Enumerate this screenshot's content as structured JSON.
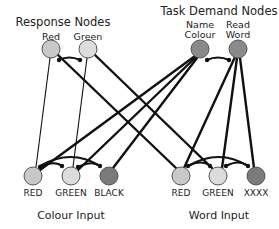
{
  "titles": {
    "response": "Response Nodes",
    "task": "Task Demand Nodes",
    "colour_input": "Colour Input",
    "word_input": "Word Input"
  },
  "response_nodes": [
    {
      "label": "Red",
      "x": 51,
      "y": 49,
      "fill": "#c8c8c8"
    },
    {
      "label": "Green",
      "x": 88,
      "y": 49,
      "fill": "#dcdcdc"
    }
  ],
  "task_nodes": [
    {
      "label_line1": "Name",
      "label_line2": "Colour",
      "x": 200,
      "y": 49,
      "fill": "#8a8a8a"
    },
    {
      "label_line1": "Read",
      "label_line2": "Word",
      "x": 238,
      "y": 49,
      "fill": "#8a8a8a"
    }
  ],
  "colour_input_nodes": [
    {
      "label": "RED",
      "x": 33,
      "y": 176,
      "fill": "#c8c8c8"
    },
    {
      "label": "GREEN",
      "x": 71,
      "y": 176,
      "fill": "#dcdcdc"
    },
    {
      "label": "BLACK",
      "x": 109,
      "y": 176,
      "fill": "#7a7a7a"
    }
  ],
  "word_input_nodes": [
    {
      "label": "RED",
      "x": 181,
      "y": 176,
      "fill": "#c8c8c8"
    },
    {
      "label": "GREEN",
      "x": 218,
      "y": 176,
      "fill": "#dcdcdc"
    },
    {
      "label": "XXXX",
      "x": 256,
      "y": 176,
      "fill": "#7a7a7a"
    }
  ],
  "colors": {
    "edge": "#111111",
    "node_stroke": "#555555"
  }
}
